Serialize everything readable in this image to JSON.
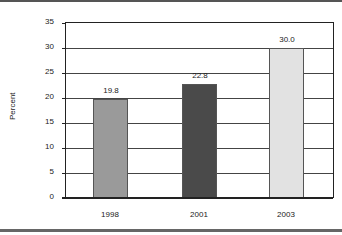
{
  "chart_data": {
    "type": "bar",
    "title": "",
    "xlabel": "",
    "ylabel": "Percent",
    "categories": [
      "1998",
      "2001",
      "2003"
    ],
    "values": [
      19.8,
      22.8,
      30.0
    ],
    "value_labels": [
      "19.8",
      "22.8",
      "30.0"
    ],
    "bar_colors": [
      "#9a9a9a",
      "#4a4a4a",
      "#e2e2e2"
    ],
    "ylim": [
      0,
      35
    ],
    "yticks": [
      "0",
      "5",
      "10",
      "15",
      "20",
      "25",
      "30",
      "35"
    ],
    "grid": true,
    "legend": null
  }
}
